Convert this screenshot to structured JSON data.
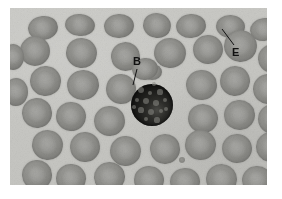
{
  "figure": {
    "kind": "light-micrograph",
    "frame_background": "#ffffff",
    "plate": {
      "x": 10,
      "y": 8,
      "width": 257,
      "height": 177
    },
    "palette": {
      "plasma": "#c8c8c4",
      "erythrocyte": "#8d8d89",
      "erythrocyte_center": "#9b9b97",
      "basophil": "#1a1a18",
      "label_text": "#111111",
      "leader_line": "#111111"
    }
  },
  "annotations": [
    {
      "id": "label-b",
      "text": "B",
      "meaning": "basophil",
      "text_x": 133,
      "text_y": 56,
      "leader": {
        "x1": 137,
        "y1": 69,
        "x2": 133,
        "y2": 85
      }
    },
    {
      "id": "label-e",
      "text": "E",
      "meaning": "erythrocyte",
      "text_x": 232,
      "text_y": 47,
      "leader": {
        "x1": 234,
        "y1": 45,
        "x2": 222,
        "y2": 29
      }
    }
  ],
  "cells": {
    "basophil": {
      "cx": 142,
      "cy": 97,
      "r": 21,
      "granules": [
        {
          "x": 131,
          "y": 82,
          "r": 3.0
        },
        {
          "x": 140,
          "y": 85,
          "r": 2.2
        },
        {
          "x": 150,
          "y": 84,
          "r": 2.6
        },
        {
          "x": 127,
          "y": 92,
          "r": 2.4
        },
        {
          "x": 136,
          "y": 93,
          "r": 3.2
        },
        {
          "x": 146,
          "y": 95,
          "r": 2.8
        },
        {
          "x": 155,
          "y": 92,
          "r": 2.2
        },
        {
          "x": 131,
          "y": 102,
          "r": 2.6
        },
        {
          "x": 141,
          "y": 104,
          "r": 3.4
        },
        {
          "x": 151,
          "y": 103,
          "r": 2.4
        },
        {
          "x": 136,
          "y": 111,
          "r": 2.2
        },
        {
          "x": 147,
          "y": 112,
          "r": 2.6
        },
        {
          "x": 156,
          "y": 101,
          "r": 2.0
        },
        {
          "x": 124,
          "y": 99,
          "r": 1.8
        },
        {
          "x": 144,
          "y": 76,
          "r": 1.8
        }
      ]
    },
    "platelets": [
      {
        "x": 172,
        "y": 152,
        "r": 3.4
      }
    ],
    "erythrocytes": [
      {
        "x": 18,
        "y": 8,
        "w": 30,
        "h": 24,
        "rot": -8
      },
      {
        "x": 55,
        "y": 6,
        "w": 30,
        "h": 22,
        "rot": 6
      },
      {
        "x": 94,
        "y": 6,
        "w": 30,
        "h": 24,
        "rot": -4
      },
      {
        "x": 133,
        "y": 5,
        "w": 28,
        "h": 25,
        "rot": 10
      },
      {
        "x": 166,
        "y": 6,
        "w": 30,
        "h": 24,
        "rot": -6
      },
      {
        "x": 206,
        "y": 7,
        "w": 29,
        "h": 23,
        "rot": 4
      },
      {
        "x": 240,
        "y": 10,
        "w": 28,
        "h": 23,
        "rot": -10
      },
      {
        "x": 10,
        "y": 28,
        "w": 30,
        "h": 30,
        "rot": 0
      },
      {
        "x": 56,
        "y": 30,
        "w": 31,
        "h": 30,
        "rot": 12
      },
      {
        "x": 101,
        "y": 34,
        "w": 29,
        "h": 29,
        "rot": -8
      },
      {
        "x": 144,
        "y": 30,
        "w": 32,
        "h": 30,
        "rot": 5
      },
      {
        "x": 183,
        "y": 27,
        "w": 30,
        "h": 29,
        "rot": -3
      },
      {
        "x": 214,
        "y": 22,
        "w": 33,
        "h": 32,
        "rot": 8
      },
      {
        "x": 248,
        "y": 36,
        "w": 30,
        "h": 29,
        "rot": -5
      },
      {
        "x": 20,
        "y": 58,
        "w": 31,
        "h": 30,
        "rot": 7
      },
      {
        "x": 57,
        "y": 62,
        "w": 32,
        "h": 30,
        "rot": -9
      },
      {
        "x": 96,
        "y": 66,
        "w": 30,
        "h": 30,
        "rot": 3
      },
      {
        "x": 176,
        "y": 62,
        "w": 31,
        "h": 30,
        "rot": -6
      },
      {
        "x": 210,
        "y": 58,
        "w": 30,
        "h": 30,
        "rot": 10
      },
      {
        "x": 243,
        "y": 66,
        "w": 31,
        "h": 30,
        "rot": -2
      },
      {
        "x": 12,
        "y": 90,
        "w": 30,
        "h": 30,
        "rot": -12
      },
      {
        "x": 46,
        "y": 94,
        "w": 30,
        "h": 29,
        "rot": 5
      },
      {
        "x": 84,
        "y": 98,
        "w": 31,
        "h": 30,
        "rot": -4
      },
      {
        "x": 178,
        "y": 96,
        "w": 30,
        "h": 29,
        "rot": 8
      },
      {
        "x": 214,
        "y": 92,
        "w": 31,
        "h": 30,
        "rot": -7
      },
      {
        "x": 248,
        "y": 96,
        "w": 30,
        "h": 30,
        "rot": 2
      },
      {
        "x": 22,
        "y": 122,
        "w": 31,
        "h": 30,
        "rot": 9
      },
      {
        "x": 60,
        "y": 124,
        "w": 30,
        "h": 30,
        "rot": -5
      },
      {
        "x": 100,
        "y": 128,
        "w": 31,
        "h": 30,
        "rot": 4
      },
      {
        "x": 140,
        "y": 126,
        "w": 30,
        "h": 30,
        "rot": -9
      },
      {
        "x": 175,
        "y": 122,
        "w": 31,
        "h": 30,
        "rot": 6
      },
      {
        "x": 212,
        "y": 126,
        "w": 30,
        "h": 29,
        "rot": -3
      },
      {
        "x": 246,
        "y": 124,
        "w": 30,
        "h": 30,
        "rot": 7
      },
      {
        "x": 12,
        "y": 152,
        "w": 30,
        "h": 30,
        "rot": -6
      },
      {
        "x": 46,
        "y": 156,
        "w": 30,
        "h": 29,
        "rot": 5
      },
      {
        "x": 84,
        "y": 154,
        "w": 31,
        "h": 30,
        "rot": -10
      },
      {
        "x": 124,
        "y": 158,
        "w": 30,
        "h": 28,
        "rot": 3
      },
      {
        "x": 160,
        "y": 160,
        "w": 30,
        "h": 27,
        "rot": -4
      },
      {
        "x": 196,
        "y": 156,
        "w": 31,
        "h": 30,
        "rot": 8
      },
      {
        "x": 232,
        "y": 158,
        "w": 30,
        "h": 28,
        "rot": -6
      },
      {
        "x": 258,
        "y": 140,
        "w": 26,
        "h": 28,
        "rot": 4
      },
      {
        "x": -6,
        "y": 70,
        "w": 24,
        "h": 28,
        "rot": 0
      },
      {
        "x": -8,
        "y": 36,
        "w": 22,
        "h": 26,
        "rot": 0
      },
      {
        "x": 132,
        "y": 56,
        "w": 20,
        "h": 16,
        "rot": 0
      },
      {
        "x": 122,
        "y": 50,
        "w": 26,
        "h": 22,
        "rot": -6
      }
    ]
  }
}
